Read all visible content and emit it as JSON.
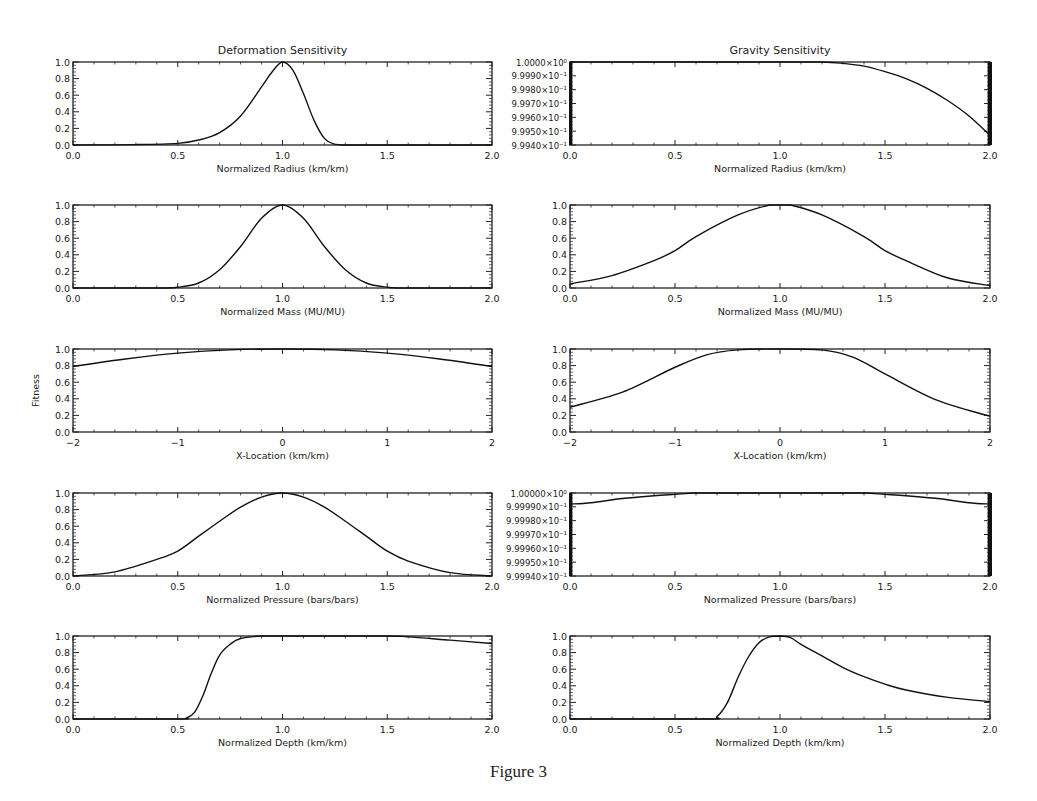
{
  "figure": {
    "caption": "Figure 3",
    "column_titles": [
      "Deformation Sensitivity",
      "Gravity Sensitivity"
    ],
    "shared_ylabel": "Fitness"
  },
  "chart_data": [
    {
      "type": "line",
      "panel": "deformation-radius",
      "column": 0,
      "row": 0,
      "title": "Deformation Sensitivity",
      "xlabel": "Normalized Radius (km/km)",
      "ylabel": "",
      "xlim": [
        0.0,
        2.0
      ],
      "ylim": [
        0.0,
        1.0
      ],
      "xticks": [
        "0.0",
        "0.5",
        "1.0",
        "1.5",
        "2.0"
      ],
      "yticks": [
        "0.0",
        "0.2",
        "0.4",
        "0.6",
        "0.8",
        "1.0"
      ],
      "x": [
        0.0,
        0.3,
        0.5,
        0.6,
        0.7,
        0.8,
        0.9,
        0.95,
        1.0,
        1.05,
        1.1,
        1.15,
        1.2,
        1.25,
        1.3,
        1.5,
        2.0
      ],
      "y": [
        0.0,
        0.005,
        0.02,
        0.06,
        0.15,
        0.35,
        0.7,
        0.88,
        1.0,
        0.9,
        0.62,
        0.3,
        0.08,
        0.01,
        0.0,
        0.0,
        0.0
      ]
    },
    {
      "type": "line",
      "panel": "gravity-radius",
      "column": 1,
      "row": 0,
      "title": "Gravity Sensitivity",
      "xlabel": "Normalized Radius (km/km)",
      "ylabel": "",
      "xlim": [
        0.0,
        2.0
      ],
      "ylim": [
        0.9994,
        1.0
      ],
      "xticks": [
        "0.0",
        "0.5",
        "1.0",
        "1.5",
        "2.0"
      ],
      "yticks": [
        "9.9940×10⁻¹",
        "9.9950×10⁻¹",
        "9.9960×10⁻¹",
        "9.9970×10⁻¹",
        "9.9980×10⁻¹",
        "9.9990×10⁻¹",
        "1.0000×10⁰"
      ],
      "x": [
        0.0,
        1.0,
        1.2,
        1.3,
        1.4,
        1.5,
        1.6,
        1.7,
        1.8,
        1.9,
        2.0
      ],
      "y": [
        1.0,
        1.0,
        1.0,
        0.99999,
        0.99997,
        0.99993,
        0.99988,
        0.99981,
        0.99972,
        0.99961,
        0.99947
      ]
    },
    {
      "type": "line",
      "panel": "deformation-mass",
      "column": 0,
      "row": 1,
      "xlabel": "Normalized Mass (MU/MU)",
      "ylabel": "",
      "xlim": [
        0.0,
        2.0
      ],
      "ylim": [
        0.0,
        1.0
      ],
      "xticks": [
        "0.0",
        "0.5",
        "1.0",
        "1.5",
        "2.0"
      ],
      "yticks": [
        "0.0",
        "0.2",
        "0.4",
        "0.6",
        "0.8",
        "1.0"
      ],
      "x": [
        0.0,
        0.4,
        0.5,
        0.6,
        0.7,
        0.8,
        0.9,
        1.0,
        1.1,
        1.2,
        1.3,
        1.4,
        1.5,
        1.6,
        2.0
      ],
      "y": [
        0.0,
        0.0,
        0.01,
        0.06,
        0.22,
        0.5,
        0.84,
        1.0,
        0.84,
        0.5,
        0.22,
        0.06,
        0.01,
        0.0,
        0.0
      ]
    },
    {
      "type": "line",
      "panel": "gravity-mass",
      "column": 1,
      "row": 1,
      "xlabel": "Normalized Mass (MU/MU)",
      "ylabel": "",
      "xlim": [
        0.0,
        2.0
      ],
      "ylim": [
        0.0,
        1.0
      ],
      "xticks": [
        "0.0",
        "0.5",
        "1.0",
        "1.5",
        "2.0"
      ],
      "yticks": [
        "0.0",
        "0.2",
        "0.4",
        "0.6",
        "0.8",
        "1.0"
      ],
      "x": [
        0.0,
        0.2,
        0.4,
        0.5,
        0.6,
        0.8,
        0.95,
        1.0,
        1.05,
        1.2,
        1.4,
        1.5,
        1.6,
        1.8,
        2.0
      ],
      "y": [
        0.05,
        0.15,
        0.33,
        0.45,
        0.62,
        0.88,
        1.0,
        1.0,
        1.0,
        0.88,
        0.62,
        0.45,
        0.33,
        0.12,
        0.03
      ]
    },
    {
      "type": "line",
      "panel": "deformation-xlocation",
      "column": 0,
      "row": 2,
      "xlabel": "X-Location (km/km)",
      "ylabel": "Fitness",
      "xlim": [
        -2,
        2
      ],
      "ylim": [
        0.0,
        1.0
      ],
      "xticks": [
        "-2",
        "-1",
        "0",
        "1",
        "2"
      ],
      "yticks": [
        "0.0",
        "0.2",
        "0.4",
        "0.6",
        "0.8",
        "1.0"
      ],
      "x": [
        -2,
        -1.5,
        -1,
        -0.5,
        0,
        0.5,
        1,
        1.5,
        2
      ],
      "y": [
        0.79,
        0.88,
        0.95,
        0.99,
        1.0,
        0.99,
        0.95,
        0.88,
        0.79
      ]
    },
    {
      "type": "line",
      "panel": "gravity-xlocation",
      "column": 1,
      "row": 2,
      "xlabel": "X-Location (km/km)",
      "ylabel": "",
      "xlim": [
        -2,
        2
      ],
      "ylim": [
        0.0,
        1.0
      ],
      "xticks": [
        "-2",
        "-1",
        "0",
        "1",
        "2"
      ],
      "yticks": [
        "0.0",
        "0.2",
        "0.4",
        "0.6",
        "0.8",
        "1.0"
      ],
      "x": [
        -2,
        -1.5,
        -1,
        -0.7,
        -0.4,
        0,
        0.4,
        0.7,
        1,
        1.5,
        2
      ],
      "y": [
        0.3,
        0.48,
        0.78,
        0.93,
        0.99,
        1.0,
        0.99,
        0.9,
        0.7,
        0.38,
        0.19
      ]
    },
    {
      "type": "line",
      "panel": "deformation-pressure",
      "column": 0,
      "row": 3,
      "xlabel": "Normalized Pressure (bars/bars)",
      "ylabel": "",
      "xlim": [
        0.0,
        2.0
      ],
      "ylim": [
        0.0,
        1.0
      ],
      "xticks": [
        "0.0",
        "0.5",
        "1.0",
        "1.5",
        "2.0"
      ],
      "yticks": [
        "0.0",
        "0.2",
        "0.4",
        "0.6",
        "0.8",
        "1.0"
      ],
      "x": [
        0.0,
        0.2,
        0.4,
        0.5,
        0.6,
        0.7,
        0.8,
        0.9,
        1.0,
        1.1,
        1.2,
        1.3,
        1.4,
        1.5,
        1.6,
        1.8,
        2.0
      ],
      "y": [
        0.0,
        0.05,
        0.2,
        0.3,
        0.48,
        0.66,
        0.83,
        0.95,
        1.0,
        0.95,
        0.83,
        0.66,
        0.48,
        0.3,
        0.18,
        0.04,
        0.0
      ]
    },
    {
      "type": "line",
      "panel": "gravity-pressure",
      "column": 1,
      "row": 3,
      "xlabel": "Normalized Pressure (bars/bars)",
      "ylabel": "",
      "xlim": [
        0.0,
        2.0
      ],
      "ylim": [
        0.99994,
        1.0
      ],
      "xticks": [
        "0.0",
        "0.5",
        "1.0",
        "1.5",
        "2.0"
      ],
      "yticks": [
        "9.99940×10⁻¹",
        "9.99950×10⁻¹",
        "9.99960×10⁻¹",
        "9.99970×10⁻¹",
        "9.99980×10⁻¹",
        "9.99990×10⁻¹",
        "1.00000×10⁰"
      ],
      "x": [
        0.0,
        0.1,
        0.25,
        0.4,
        0.5,
        0.6,
        0.75,
        1.0,
        1.25,
        1.4,
        1.5,
        1.6,
        1.75,
        1.9,
        2.0
      ],
      "y": [
        0.999992,
        0.999993,
        0.999996,
        0.999998,
        0.999999,
        1.0,
        1.0,
        1.0,
        1.0,
        1.0,
        0.999999,
        0.999998,
        0.999996,
        0.999993,
        0.999992
      ]
    },
    {
      "type": "line",
      "panel": "deformation-depth",
      "column": 0,
      "row": 4,
      "xlabel": "Normalized Depth (km/km)",
      "ylabel": "",
      "xlim": [
        0.0,
        2.0
      ],
      "ylim": [
        0.0,
        1.0
      ],
      "xticks": [
        "0.0",
        "0.5",
        "1.0",
        "1.5",
        "2.0"
      ],
      "yticks": [
        "0.0",
        "0.2",
        "0.4",
        "0.6",
        "0.8",
        "1.0"
      ],
      "x": [
        0.0,
        0.5,
        0.54,
        0.58,
        0.62,
        0.66,
        0.7,
        0.75,
        0.8,
        0.9,
        1.0,
        1.5,
        1.6,
        1.8,
        2.0
      ],
      "y": [
        0.0,
        0.0,
        0.01,
        0.08,
        0.28,
        0.55,
        0.77,
        0.9,
        0.97,
        1.0,
        1.0,
        1.0,
        0.99,
        0.95,
        0.91
      ]
    },
    {
      "type": "line",
      "panel": "gravity-depth",
      "column": 1,
      "row": 4,
      "xlabel": "Normalized Depth (km/km)",
      "ylabel": "",
      "xlim": [
        0.0,
        2.0
      ],
      "ylim": [
        0.0,
        1.0
      ],
      "xticks": [
        "0.0",
        "0.5",
        "1.0",
        "1.5",
        "2.0"
      ],
      "yticks": [
        "0.0",
        "0.2",
        "0.4",
        "0.6",
        "0.8",
        "1.0"
      ],
      "x": [
        0.0,
        0.65,
        0.7,
        0.75,
        0.8,
        0.85,
        0.9,
        0.95,
        1.0,
        1.05,
        1.1,
        1.2,
        1.3,
        1.4,
        1.5,
        1.6,
        1.8,
        2.0
      ],
      "y": [
        0.0,
        0.0,
        0.03,
        0.2,
        0.5,
        0.75,
        0.92,
        0.99,
        1.0,
        0.98,
        0.9,
        0.76,
        0.62,
        0.51,
        0.42,
        0.35,
        0.26,
        0.21
      ]
    }
  ]
}
